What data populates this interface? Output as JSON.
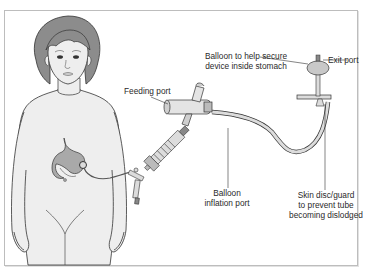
{
  "diagram": {
    "labels": {
      "feeding_port": "Feeding port",
      "balloon_secure_line1": "Balloon to help secure",
      "balloon_secure_line2": "device inside stomach",
      "exit_port": "Exit port",
      "balloon_inflation_line1": "Balloon",
      "balloon_inflation_line2": "inflation port",
      "skin_disc_line1": "Skin disc/guard",
      "skin_disc_line2": "to prevent tube",
      "skin_disc_line3": "becoming dislodged"
    },
    "colors": {
      "hair": "#8c8c8c",
      "skin": "#eeeeee",
      "stomach": "#a9a9a9",
      "outline": "#333333",
      "device": "#dcdcdc",
      "frame": "#bdbdbd"
    }
  }
}
